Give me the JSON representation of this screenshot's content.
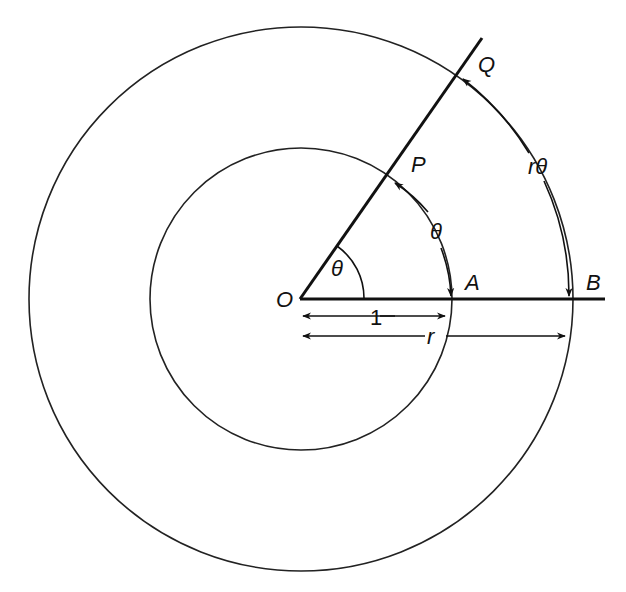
{
  "diagram": {
    "type": "geometry",
    "stroke_color": "#111111",
    "background": "#ffffff",
    "center": {
      "label": "O",
      "x": 301,
      "y": 299
    },
    "circles": [
      {
        "name": "inner-circle",
        "radius_label": "1",
        "r": 151
      },
      {
        "name": "outer-circle",
        "radius_label": "r",
        "r": 272
      }
    ],
    "points": {
      "O": "O",
      "A": "A",
      "B": "B",
      "P": "P",
      "Q": "Q"
    },
    "angle": {
      "label": "θ"
    },
    "arcs": {
      "inner_arc_label": "θ",
      "outer_arc_label": "rθ"
    },
    "dimensions": {
      "inner_radius_label": "1",
      "outer_radius_label": "r"
    }
  }
}
